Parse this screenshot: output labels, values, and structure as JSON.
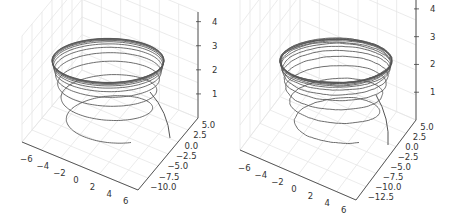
{
  "chart_data": [
    {
      "type": "line",
      "projection": "3d",
      "title": "",
      "xlabel": "",
      "ylabel": "",
      "zlabel": "",
      "description": "3D spiral trajectory rising from z~0.5 and converging to a stable orbit near z~4 (smooth)",
      "x_ticks": [
        "−6",
        "−4",
        "−2",
        "0",
        "2",
        "4",
        "6"
      ],
      "y_ticks": [
        "5.0",
        "2.5",
        "0.0",
        "−2.5",
        "−5.0",
        "−7.5",
        "−10.0"
      ],
      "z_ticks": [
        "1",
        "2",
        "3",
        "4"
      ],
      "xlim": [
        -7,
        7
      ],
      "ylim": [
        -11,
        6
      ],
      "zlim": [
        0,
        4.8
      ],
      "grid": true,
      "line_color": "#555555",
      "series": [
        {
          "name": "trajectory",
          "radius": 6,
          "z_start": 0.4,
          "z_end": 4.2,
          "turns": 12,
          "noise": 0
        }
      ]
    },
    {
      "type": "line",
      "projection": "3d",
      "title": "",
      "xlabel": "",
      "ylabel": "",
      "zlabel": "",
      "description": "3D spiral trajectory rising from z~0.5 and converging to a stable orbit near z~4.3 (noisy)",
      "x_ticks": [
        "−6",
        "−4",
        "−2",
        "0",
        "2",
        "4",
        "6"
      ],
      "y_ticks": [
        "5.0",
        "2.5",
        "0.0",
        "−2.5",
        "−5.0",
        "−7.5",
        "−10.0",
        "−12.5"
      ],
      "z_ticks": [
        "1",
        "2",
        "3",
        "4",
        "5"
      ],
      "xlim": [
        -7,
        7
      ],
      "ylim": [
        -13,
        6
      ],
      "zlim": [
        0,
        5.3
      ],
      "grid": true,
      "line_color": "#555555",
      "series": [
        {
          "name": "trajectory",
          "radius": 6,
          "z_start": 0.4,
          "z_end": 4.4,
          "turns": 14,
          "noise": 1
        }
      ]
    }
  ]
}
